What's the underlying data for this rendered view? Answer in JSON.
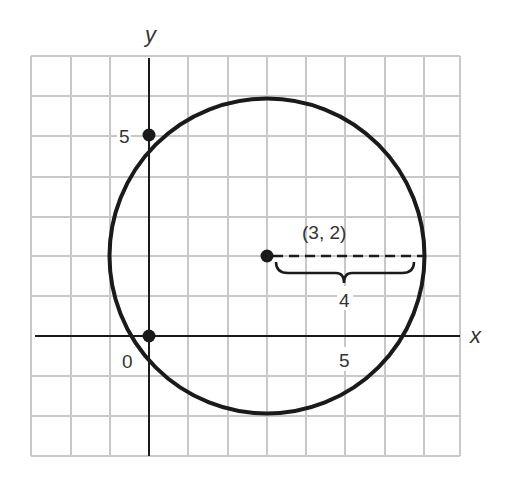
{
  "diagram": {
    "type": "coordinate-plane-circle",
    "axes": {
      "x_label": "x",
      "y_label": "y",
      "origin_label": "0",
      "x_tick_label": "5",
      "y_tick_label": "5"
    },
    "grid": {
      "x_min": -3,
      "x_max": 8,
      "y_min": -3,
      "y_max": 7,
      "step": 1
    },
    "circle": {
      "center": [
        3,
        2
      ],
      "radius": 4
    },
    "points": [
      {
        "label": "(3, 2)",
        "x": 3,
        "y": 2,
        "role": "center"
      },
      {
        "x": 0,
        "y": 5,
        "role": "y-axis-point"
      },
      {
        "x": 0,
        "y": 0,
        "role": "origin-point"
      }
    ],
    "center_label": "(3, 2)",
    "radius_label": "4",
    "colors": {
      "grid": "#c8c8c8",
      "ink": "#1a1a1a",
      "text": "#333333"
    }
  }
}
